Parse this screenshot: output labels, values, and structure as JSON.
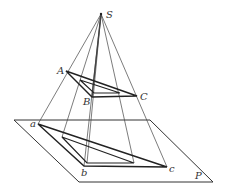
{
  "diagram": {
    "colors": {
      "line": "#333333",
      "bold": "#222222",
      "background": "#ffffff"
    },
    "labels": {
      "S": "S",
      "A": "A",
      "B": "B",
      "C": "C",
      "a": "a",
      "b": "b",
      "c": "c",
      "P": "P"
    },
    "points": {
      "S": [
        101,
        14
      ],
      "A": [
        66,
        71
      ],
      "B": [
        92,
        97
      ],
      "C": [
        137,
        96
      ],
      "a": [
        38,
        124
      ],
      "b": [
        84,
        166
      ],
      "c": [
        167,
        167
      ]
    },
    "plane": {
      "name": "P",
      "corners": [
        [
          14,
          120
        ],
        [
          150,
          120
        ],
        [
          213,
          182
        ],
        [
          79,
          182
        ]
      ]
    }
  }
}
